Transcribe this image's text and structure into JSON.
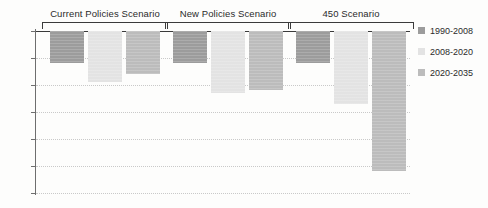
{
  "chart_data": {
    "type": "bar",
    "title": "",
    "subtitle": "",
    "xlabel": "",
    "ylabel": "",
    "categories": [
      "Current Policies Scenario",
      "New Policies Scenario",
      "450 Scenario"
    ],
    "series": [
      {
        "name": "1990-2008",
        "color": "#9c9c9c",
        "values": [
          -1.2,
          -1.2,
          -1.2
        ]
      },
      {
        "name": "2008-2020",
        "color": "#e3e3e3",
        "values": [
          -1.9,
          -2.3,
          -2.7
        ]
      },
      {
        "name": "2020-2035",
        "color": "#bcbcbc",
        "values": [
          -1.6,
          -2.2,
          -5.2
        ]
      }
    ],
    "ylim": [
      -6,
      0
    ],
    "ytick_values": [
      0,
      -1,
      -2,
      -3,
      -4,
      -5,
      -6
    ],
    "ytick_labels": [
      "0%",
      "-1%",
      "-2%",
      "-3%",
      "-4%",
      "-5%",
      "-6%"
    ],
    "grid": true,
    "grid_style": "dotted",
    "legend_position": "right",
    "axis_color": "#6e6e6e",
    "background_color": "#fdfdfc"
  },
  "legend": {
    "items": [
      {
        "label": "1990-2008",
        "color": "#9c9c9c"
      },
      {
        "label": "2008-2020",
        "color": "#e3e3e3"
      },
      {
        "label": "2020-2035",
        "color": "#bcbcbc"
      }
    ]
  }
}
